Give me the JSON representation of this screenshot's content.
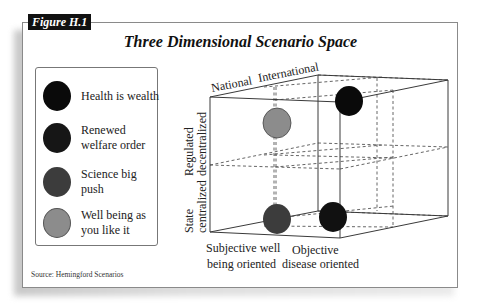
{
  "figure": {
    "tag": "Figure H.1",
    "title": "Three Dimensional Scenario Space",
    "source": "Source: Hemingford Scenarios"
  },
  "legend": {
    "items": [
      {
        "label": "Health is wealth",
        "color": "#0a0a0a"
      },
      {
        "label": "Renewed welfare order",
        "color": "#161616"
      },
      {
        "label": "Science big push",
        "color": "#3c3c3c"
      },
      {
        "label": "Well being as you like it",
        "color": "#8c8c8c"
      }
    ]
  },
  "axes": {
    "depth_axis": {
      "front": "National",
      "back": "International"
    },
    "vertical_axis": {
      "top": [
        "Regulated",
        "decentralized"
      ],
      "bottom": [
        "State",
        "centralized"
      ]
    },
    "horizontal_axis": {
      "left": [
        "Subjective well",
        "being oriented"
      ],
      "right": [
        "Objective",
        "disease oriented"
      ]
    }
  },
  "scenarios": [
    {
      "name": "Health is wealth",
      "position": "regulated-decentralized / objective-disease / international",
      "color": "#0a0a0a"
    },
    {
      "name": "Renewed welfare order",
      "position": "state-centralized / objective-disease / national",
      "color": "#161616"
    },
    {
      "name": "Science big push",
      "position": "state-centralized / subjective-wellbeing / national",
      "color": "#3c3c3c"
    },
    {
      "name": "Well being as you like it",
      "position": "regulated-decentralized / subjective-wellbeing / international",
      "color": "#8c8c8c"
    }
  ],
  "colors": {
    "frame_border": "#8a8a8a",
    "tag_bg": "#111111",
    "line": "#444444"
  }
}
